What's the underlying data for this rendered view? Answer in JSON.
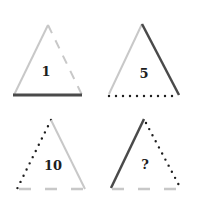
{
  "puzzle": {
    "type": "triangle-number-puzzle",
    "colors": {
      "dark": "#4a4a4a",
      "light": "#c8c8c8",
      "dotted": "#1e1e1e",
      "text": "#1e1e1e",
      "background": "#ffffff"
    },
    "triangles": [
      {
        "id": "top-left",
        "label": "1",
        "apex": [
          48,
          25
        ],
        "base_left": [
          14,
          95
        ],
        "base_right": [
          82,
          95
        ],
        "label_pos": [
          46,
          76
        ],
        "sides": {
          "left": "light-solid",
          "right": "light-dashed",
          "bottom": "dark-solid"
        }
      },
      {
        "id": "top-right",
        "label": "5",
        "apex": [
          142,
          24
        ],
        "base_left": [
          109,
          95
        ],
        "base_right": [
          179,
          95
        ],
        "label_pos": [
          144,
          77
        ],
        "sides": {
          "left": "light-solid",
          "right": "dark-solid",
          "bottom": "dotted"
        }
      },
      {
        "id": "bottom-left",
        "label": "10",
        "apex": [
          51,
          120
        ],
        "base_left": [
          17,
          189
        ],
        "base_right": [
          84,
          189
        ],
        "label_pos": [
          52,
          170
        ],
        "sides": {
          "left": "dotted",
          "right": "light-solid",
          "bottom": "light-dashed"
        }
      },
      {
        "id": "bottom-right",
        "label": "?",
        "apex": [
          144,
          119
        ],
        "base_left": [
          111,
          189
        ],
        "base_right": [
          181,
          189
        ],
        "label_pos": [
          145,
          169
        ],
        "sides": {
          "left": "dark-solid",
          "right": "dotted",
          "bottom": "light-dashed"
        }
      }
    ]
  }
}
